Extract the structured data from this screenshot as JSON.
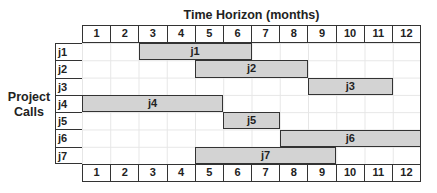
{
  "chart_data": {
    "type": "gantt",
    "title": "Time Horizon (months)",
    "xlabel": "Time Horizon (months)",
    "ylabel": "Project Calls",
    "categories": [
      "1",
      "2",
      "3",
      "4",
      "5",
      "6",
      "7",
      "8",
      "9",
      "10",
      "11",
      "12"
    ],
    "rows": [
      "j1",
      "j2",
      "j3",
      "j4",
      "j5",
      "j6",
      "j7"
    ],
    "bars": [
      {
        "row": "j1",
        "label": "j1",
        "start": 3,
        "end": 6
      },
      {
        "row": "j2",
        "label": "j2",
        "start": 5,
        "end": 8
      },
      {
        "row": "j3",
        "label": "j3",
        "start": 9,
        "end": 11
      },
      {
        "row": "j4",
        "label": "j4",
        "start": 1,
        "end": 5
      },
      {
        "row": "j5",
        "label": "j5",
        "start": 6,
        "end": 7
      },
      {
        "row": "j6",
        "label": "j6",
        "start": 8,
        "end": 12
      },
      {
        "row": "j7",
        "label": "j7",
        "start": 5,
        "end": 9
      }
    ],
    "grid": true,
    "bar_color": "#d3d3d3"
  },
  "labels": {
    "title": "Time Horizon (months)",
    "ylabel_line1": "Project",
    "ylabel_line2": "Calls"
  }
}
